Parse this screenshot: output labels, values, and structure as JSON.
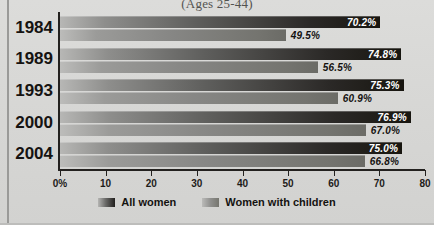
{
  "chart_data": {
    "type": "bar",
    "orientation": "horizontal",
    "title": "(Ages 25-44)",
    "xlabel": "",
    "ylabel": "",
    "xlim": [
      0,
      80
    ],
    "xticks": [
      "0%",
      "10",
      "20",
      "30",
      "40",
      "50",
      "60",
      "70",
      "80"
    ],
    "xtick_values": [
      0,
      10,
      20,
      30,
      40,
      50,
      60,
      70,
      80
    ],
    "grid": false,
    "legend_position": "bottom",
    "categories": [
      "1984",
      "1989",
      "1993",
      "2000",
      "2004"
    ],
    "series": [
      {
        "name": "All women",
        "values": [
          70.2,
          74.8,
          75.3,
          76.9,
          75.0
        ],
        "labels": [
          "70.2%",
          "74.8%",
          "75.3%",
          "76.9%",
          "75.0%"
        ],
        "color": "#211f1d"
      },
      {
        "name": "Women with children",
        "values": [
          49.5,
          56.5,
          60.9,
          67.0,
          66.8
        ],
        "labels": [
          "49.5%",
          "56.5%",
          "60.9%",
          "67.0%",
          "66.8%"
        ],
        "color": "#85857f"
      }
    ]
  },
  "legend": {
    "items": [
      {
        "label": "All women"
      },
      {
        "label": "Women with children"
      }
    ]
  }
}
